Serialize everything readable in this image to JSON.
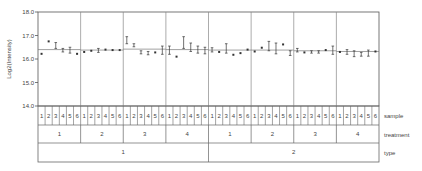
{
  "chart_data": {
    "type": "scatter",
    "title": "",
    "xlabel": "",
    "ylabel": "Log2(Intensity)",
    "ylim": [
      14.0,
      18.0
    ],
    "yticks": [
      "14.0",
      "15.0",
      "16.0",
      "17.0",
      "18.0"
    ],
    "grid": false,
    "legend": null,
    "x_axis_rows": [
      {
        "name": "sample",
        "label": "sample"
      },
      {
        "name": "treatment",
        "label": "treatment"
      },
      {
        "name": "type",
        "label": "type"
      }
    ],
    "groups": [
      {
        "type": "1",
        "treatment": "1",
        "reference": 16.4,
        "samples": [
          {
            "sample": "1",
            "value": 16.22,
            "low": 16.2,
            "high": 16.25
          },
          {
            "sample": "2",
            "value": 16.75,
            "low": 16.73,
            "high": 16.78
          },
          {
            "sample": "3",
            "value": 16.58,
            "low": 16.45,
            "high": 16.7
          },
          {
            "sample": "4",
            "value": 16.38,
            "low": 16.3,
            "high": 16.45
          },
          {
            "sample": "5",
            "value": 16.38,
            "low": 16.25,
            "high": 16.5
          },
          {
            "sample": "6",
            "value": 16.22,
            "low": 16.2,
            "high": 16.25
          }
        ]
      },
      {
        "type": "1",
        "treatment": "2",
        "reference": 16.38,
        "samples": [
          {
            "sample": "1",
            "value": 16.3,
            "low": 16.27,
            "high": 16.33
          },
          {
            "sample": "2",
            "value": 16.35,
            "low": 16.33,
            "high": 16.38
          },
          {
            "sample": "3",
            "value": 16.38,
            "low": 16.28,
            "high": 16.45
          },
          {
            "sample": "4",
            "value": 16.4,
            "low": 16.38,
            "high": 16.42
          },
          {
            "sample": "5",
            "value": 16.38,
            "low": 16.36,
            "high": 16.4
          },
          {
            "sample": "6",
            "value": 16.38,
            "low": 16.36,
            "high": 16.4
          }
        ]
      },
      {
        "type": "1",
        "treatment": "3",
        "reference": 16.42,
        "samples": [
          {
            "sample": "1",
            "value": 16.8,
            "low": 16.65,
            "high": 16.95
          },
          {
            "sample": "2",
            "value": 16.58,
            "low": 16.52,
            "high": 16.65
          },
          {
            "sample": "3",
            "value": 16.28,
            "low": 16.22,
            "high": 16.35
          },
          {
            "sample": "4",
            "value": 16.25,
            "low": 16.18,
            "high": 16.32
          },
          {
            "sample": "5",
            "value": 16.28,
            "low": 16.26,
            "high": 16.3
          },
          {
            "sample": "6",
            "value": 16.38,
            "low": 16.2,
            "high": 16.55
          }
        ]
      },
      {
        "type": "1",
        "treatment": "4",
        "reference": 16.4,
        "samples": [
          {
            "sample": "1",
            "value": 16.4,
            "low": 16.2,
            "high": 16.55
          },
          {
            "sample": "2",
            "value": 16.1,
            "low": 16.08,
            "high": 16.12
          },
          {
            "sample": "3",
            "value": 16.7,
            "low": 16.45,
            "high": 16.95
          },
          {
            "sample": "4",
            "value": 16.5,
            "low": 16.32,
            "high": 16.68
          },
          {
            "sample": "5",
            "value": 16.4,
            "low": 16.25,
            "high": 16.55
          },
          {
            "sample": "6",
            "value": 16.35,
            "low": 16.22,
            "high": 16.5
          }
        ]
      },
      {
        "type": "2",
        "treatment": "1",
        "reference": 16.38,
        "samples": [
          {
            "sample": "1",
            "value": 16.4,
            "low": 16.3,
            "high": 16.48
          },
          {
            "sample": "2",
            "value": 16.3,
            "low": 16.28,
            "high": 16.33
          },
          {
            "sample": "3",
            "value": 16.45,
            "low": 16.25,
            "high": 16.65
          },
          {
            "sample": "4",
            "value": 16.18,
            "low": 16.16,
            "high": 16.2
          },
          {
            "sample": "5",
            "value": 16.25,
            "low": 16.22,
            "high": 16.28
          },
          {
            "sample": "6",
            "value": 16.4,
            "low": 16.38,
            "high": 16.42
          }
        ]
      },
      {
        "type": "2",
        "treatment": "2",
        "reference": 16.38,
        "samples": [
          {
            "sample": "1",
            "value": 16.32,
            "low": 16.28,
            "high": 16.36
          },
          {
            "sample": "2",
            "value": 16.48,
            "low": 16.45,
            "high": 16.52
          },
          {
            "sample": "3",
            "value": 16.55,
            "low": 16.35,
            "high": 16.75
          },
          {
            "sample": "4",
            "value": 16.45,
            "low": 16.22,
            "high": 16.68
          },
          {
            "sample": "5",
            "value": 16.62,
            "low": 16.6,
            "high": 16.65
          },
          {
            "sample": "6",
            "value": 16.25,
            "low": 16.15,
            "high": 16.35
          }
        ]
      },
      {
        "type": "2",
        "treatment": "3",
        "reference": 16.35,
        "samples": [
          {
            "sample": "1",
            "value": 16.4,
            "low": 16.3,
            "high": 16.45
          },
          {
            "sample": "2",
            "value": 16.28,
            "low": 16.26,
            "high": 16.3
          },
          {
            "sample": "3",
            "value": 16.3,
            "low": 16.25,
            "high": 16.35
          },
          {
            "sample": "4",
            "value": 16.3,
            "low": 16.25,
            "high": 16.35
          },
          {
            "sample": "5",
            "value": 16.38,
            "low": 16.35,
            "high": 16.4
          },
          {
            "sample": "6",
            "value": 16.35,
            "low": 16.2,
            "high": 16.55
          }
        ]
      },
      {
        "type": "2",
        "treatment": "4",
        "reference": 16.32,
        "samples": [
          {
            "sample": "1",
            "value": 16.3,
            "low": 16.28,
            "high": 16.32
          },
          {
            "sample": "2",
            "value": 16.3,
            "low": 16.2,
            "high": 16.4
          },
          {
            "sample": "3",
            "value": 16.22,
            "low": 16.1,
            "high": 16.35
          },
          {
            "sample": "4",
            "value": 16.2,
            "low": 16.12,
            "high": 16.28
          },
          {
            "sample": "5",
            "value": 16.25,
            "low": 16.12,
            "high": 16.38
          },
          {
            "sample": "6",
            "value": 16.32,
            "low": 16.3,
            "high": 16.34
          }
        ]
      }
    ]
  },
  "axis": {
    "ylabel": "Log2(Intensity)",
    "yticks": [
      "14.0",
      "15.0",
      "16.0",
      "17.0",
      "18.0"
    ]
  },
  "rows": {
    "sample": "sample",
    "treatment": "treatment",
    "type": "type"
  },
  "colors": {
    "axis": "#555555",
    "divider": "#888888",
    "reference_line": "#777777",
    "point": "#333333",
    "table_border": "#666666"
  }
}
